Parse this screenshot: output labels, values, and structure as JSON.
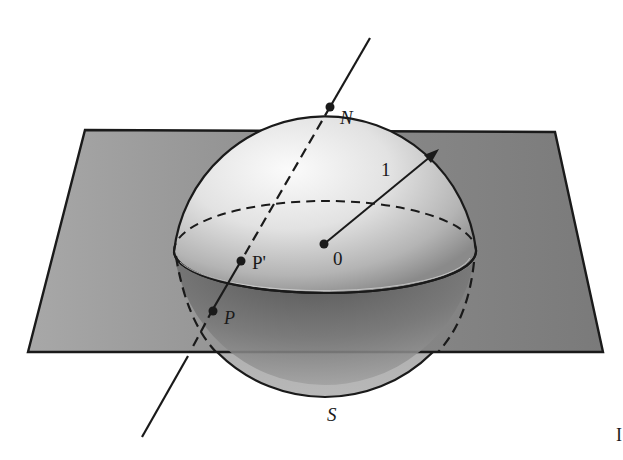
{
  "figure": {
    "labels": {
      "north": "N",
      "south": "S",
      "origin": "0",
      "point_sphere": "P'",
      "point_plane": "P",
      "radius": "1",
      "page_edge": "I"
    },
    "colors": {
      "outline": "#1a1a1a",
      "plane_fill": "#9a9a9a",
      "sphere_highlight": "#f4f4f4",
      "sphere_shadow": "#6a6a6a",
      "background": "#ffffff"
    }
  }
}
